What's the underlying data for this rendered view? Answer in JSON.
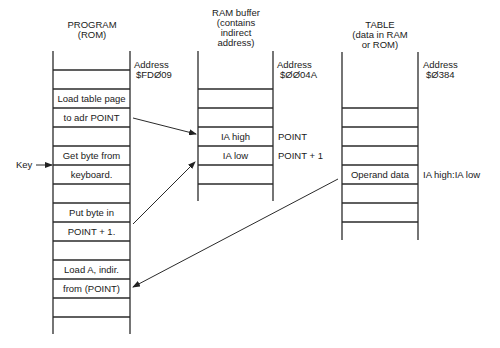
{
  "diagram": {
    "program": {
      "title_line1": "PROGRAM",
      "title_line2": "(ROM)",
      "address_label": "Address",
      "address_value": "$FDØ09",
      "cells": [
        "",
        "",
        "Load table page",
        "to adr POINT",
        "",
        "Get byte from",
        "keyboard.",
        "",
        "Put byte in",
        "POINT + 1.",
        "",
        "Load A, indir.",
        "from (POINT)",
        "",
        ""
      ]
    },
    "ram": {
      "title_line1": "RAM buffer",
      "title_line2": "(contains",
      "title_line3": "indirect",
      "title_line4": "address)",
      "address_label": "Address",
      "address_value": "$ØØ04A",
      "cells": [
        "",
        "",
        "IA high",
        "IA low",
        ""
      ],
      "side_labels": [
        "POINT",
        "POINT + 1"
      ]
    },
    "table": {
      "title_line1": "TABLE",
      "title_line2": "(data in RAM",
      "title_line3": "or ROM)",
      "address_label": "Address",
      "address_value": "$Ø384",
      "cells": [
        "",
        "",
        "",
        "Operand data",
        "",
        ""
      ],
      "side_label": "IA high:IA low"
    },
    "key_label": "Key",
    "arrows": [
      {
        "from": "to adr POINT",
        "to": "IA high"
      },
      {
        "from": "POINT + 1.",
        "to": "IA low"
      },
      {
        "from": "Operand data",
        "to": "from (POINT)"
      },
      {
        "from": "Key",
        "to": "Get byte from / keyboard."
      }
    ]
  }
}
